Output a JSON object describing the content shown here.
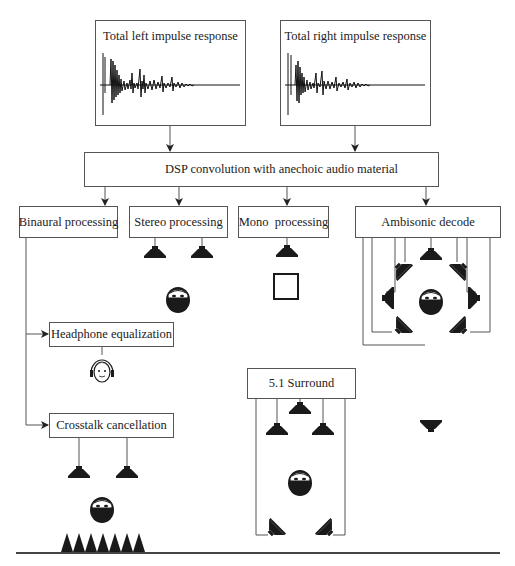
{
  "diagram": {
    "impulse_responses": {
      "left": {
        "label": "Total left impulse response"
      },
      "right": {
        "label": "Total right impulse response"
      }
    },
    "dsp": {
      "label": "DSP convolution with anechoic audio material"
    },
    "processing": {
      "binaural": {
        "label": "Binaural processing"
      },
      "stereo": {
        "label": "Stereo processing"
      },
      "mono": {
        "label": "Mono  processing"
      },
      "ambisonic": {
        "label": "Ambisonic decode"
      }
    },
    "binaural_branches": {
      "headphone": {
        "label": "Headphone equalization"
      },
      "crosstalk": {
        "label": "Crosstalk cancellation"
      }
    },
    "surround": {
      "label": "5.1 Surround"
    },
    "icons": {
      "speaker": "loudspeaker-icon",
      "listener": "listener-head-icon",
      "headphone_listener": "headphone-listener-icon",
      "mono_source": "square-source-icon",
      "absorber": "anechoic-wedges-icon"
    },
    "colors": {
      "line": "#555555",
      "fill": "#1a1a1a",
      "background": "#ffffff"
    }
  }
}
